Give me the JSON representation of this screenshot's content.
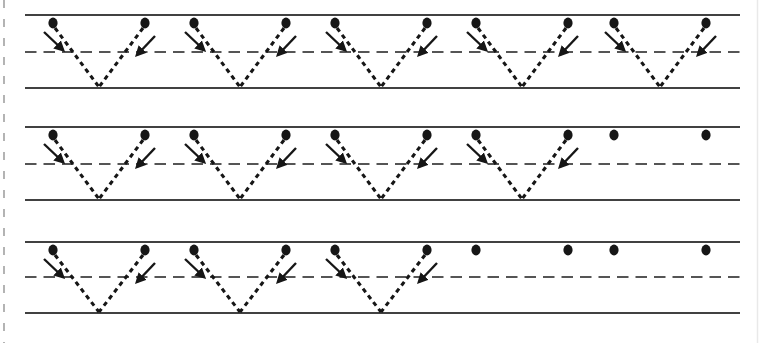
{
  "page": {
    "width": 762,
    "height": 343,
    "background": "#ffffff",
    "edge": {
      "perforation_x": 4,
      "perforation_color": "#acacac",
      "perforation_width": 1.8,
      "perforation_dash": "8 11",
      "right_shadow_x": 757.5,
      "right_shadow_color": "#e9e9e9",
      "right_shadow_width": 1.5
    }
  },
  "style": {
    "ink_color": "#161616",
    "solid_line_color": "#414141",
    "solid_line_width": 1.8,
    "midline_color": "#555555",
    "midline_width": 1.8,
    "midline_dash": "11.5 7",
    "trace_width": 3.1,
    "trace_dash": "4.5 4",
    "dot_rx": 4.6,
    "dot_ry": 5.4,
    "arrow_width": 2.4
  },
  "guides": {
    "x_start": 25,
    "x_end": 740
  },
  "grid": {
    "left_dot_xs": [
      53,
      194,
      335,
      476,
      614
    ],
    "pair_width": 92,
    "vertex_offset": 46,
    "dot_offset_y": 8,
    "stroke_start_offset": [
      2,
      13
    ],
    "vertex_bottom_offset": 1,
    "left_arrow": {
      "tail": [
        -9,
        17
      ],
      "tip": [
        10,
        35
      ]
    },
    "right_arrow": {
      "tail": [
        10,
        21
      ],
      "tip": [
        -8,
        40
      ]
    }
  },
  "rows": [
    {
      "top": 15,
      "mid": 52,
      "bottom": 88,
      "unit_count": 5,
      "traced_count": 5
    },
    {
      "top": 127,
      "mid": 164,
      "bottom": 200,
      "unit_count": 5,
      "traced_count": 4
    },
    {
      "top": 242,
      "mid": 277,
      "bottom": 313,
      "unit_count": 5,
      "traced_count": 3
    }
  ],
  "content": {
    "exercise": "letter-v-zigzag-tracing-practice",
    "rows_total": 3,
    "traced_v_shapes_per_row": [
      5,
      4,
      3
    ],
    "start_dots_per_row": [
      10,
      10,
      10
    ],
    "stroke_direction": "top-to-bottom-diagonals"
  }
}
